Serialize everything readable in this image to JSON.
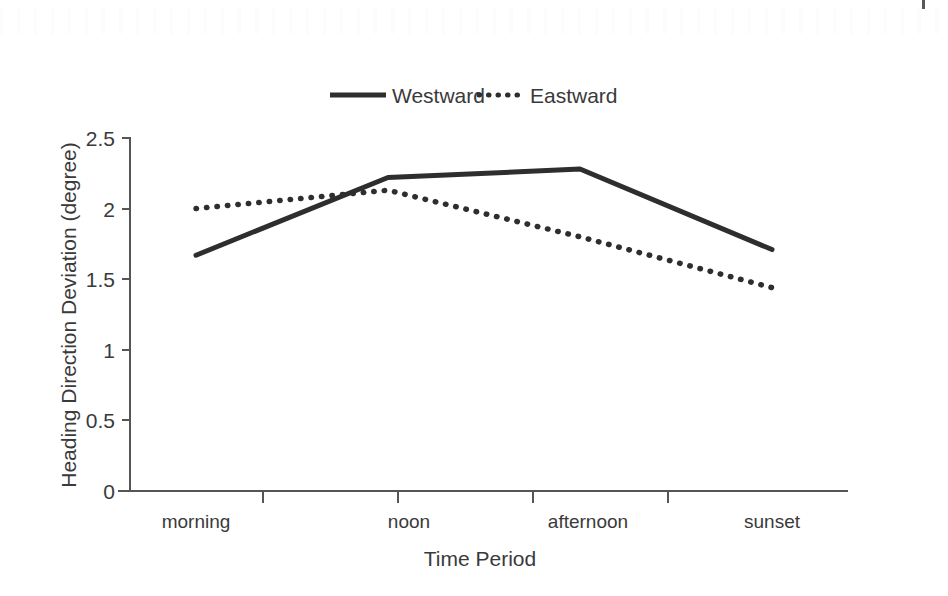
{
  "chart_data": {
    "type": "line",
    "title": "",
    "xlabel": "Time Period",
    "ylabel": "Heading Direction Deviation (degree)",
    "categories": [
      "morning",
      "noon",
      "afternoon",
      "sunset"
    ],
    "ylim": [
      0,
      2.5
    ],
    "yticks": [
      "0",
      "0.5",
      "1",
      "1.5",
      "2",
      "2.5"
    ],
    "ytick_values": [
      0,
      0.5,
      1,
      1.5,
      2,
      2.5
    ],
    "grid": false,
    "legend_position": "top-center",
    "series": [
      {
        "name": "Westward",
        "style": "solid",
        "color": "#2e2e2e",
        "values": [
          1.67,
          2.22,
          2.28,
          1.71
        ]
      },
      {
        "name": "Eastward",
        "style": "dotted",
        "color": "#2e2e2e",
        "values": [
          2.0,
          2.13,
          1.8,
          1.44
        ]
      }
    ]
  },
  "legend": {
    "items": [
      {
        "label": "Westward",
        "style": "solid"
      },
      {
        "label": "Eastward",
        "style": "dotted"
      }
    ]
  },
  "axes": {
    "y_title": "Heading Direction Deviation (degree)",
    "x_title": "Time Period",
    "y_ticks": [
      "2.5",
      "2",
      "1.5",
      "1",
      "0.5",
      "0"
    ],
    "x_ticks": [
      "morning",
      "noon",
      "afternoon",
      "sunset"
    ]
  }
}
